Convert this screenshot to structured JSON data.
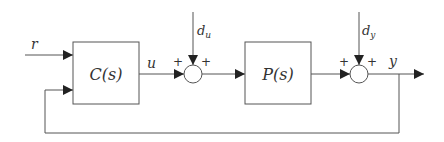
{
  "diagram": {
    "type": "feedback-control-block-diagram",
    "colors": {
      "line": "#555555",
      "text": "#333333",
      "background": "#ffffff"
    },
    "signals": {
      "reference": "r",
      "control": "u",
      "input_disturbance_base": "d",
      "input_disturbance_sub": "u",
      "output_disturbance_base": "d",
      "output_disturbance_sub": "y",
      "output": "y"
    },
    "blocks": [
      {
        "id": "controller",
        "label": "C(s)"
      },
      {
        "id": "plant",
        "label": "P(s)"
      }
    ],
    "summing_junctions": [
      {
        "id": "input-sum",
        "left_sign": "+",
        "top_sign": "+"
      },
      {
        "id": "output-sum",
        "left_sign": "+",
        "top_sign": "+"
      }
    ]
  }
}
